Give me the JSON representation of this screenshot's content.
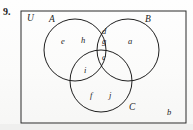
{
  "problem": {
    "number": "9."
  },
  "diagram": {
    "type": "venn-3-circle",
    "universe_label": "U",
    "stroke_color": "#1f1f1f",
    "fill_color": "none",
    "box": {
      "x": 21,
      "y": 11,
      "width": 165,
      "height": 112
    },
    "circles": [
      {
        "name": "A",
        "cx": 75,
        "cy": 50,
        "r": 31
      },
      {
        "name": "B",
        "cx": 128,
        "cy": 50,
        "r": 31
      },
      {
        "name": "C",
        "cx": 101,
        "cy": 81,
        "r": 31
      }
    ],
    "set_labels": [
      {
        "text": "U",
        "x": 28,
        "y": 17
      },
      {
        "text": "A",
        "x": 50,
        "y": 18
      },
      {
        "text": "B",
        "x": 146,
        "y": 18
      },
      {
        "text": "C",
        "x": 130,
        "y": 108
      }
    ],
    "region_labels": [
      {
        "text": "e",
        "x": 63,
        "y": 41,
        "region": "A only"
      },
      {
        "text": "h",
        "x": 83,
        "y": 40,
        "region": "A only"
      },
      {
        "text": "d",
        "x": 103,
        "y": 31,
        "region": "A and B"
      },
      {
        "text": "g",
        "x": 103,
        "y": 41,
        "region": "A and B"
      },
      {
        "text": "a",
        "x": 130,
        "y": 41,
        "region": "B only"
      },
      {
        "text": "c",
        "x": 103,
        "y": 57,
        "region": "A and B and C"
      },
      {
        "text": "i",
        "x": 85,
        "y": 70,
        "region": "A and C"
      },
      {
        "text": "f",
        "x": 91,
        "y": 95,
        "region": "C only"
      },
      {
        "text": "j",
        "x": 110,
        "y": 95,
        "region": "C only"
      },
      {
        "text": "b",
        "x": 168,
        "y": 112,
        "region": "outside all sets"
      }
    ]
  }
}
